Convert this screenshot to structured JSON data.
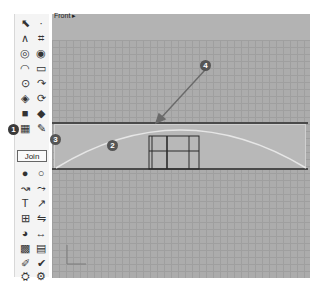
{
  "toolbar": {
    "join_label": "Join",
    "tools": [
      {
        "name": "select-arrow-icon",
        "glyph": "⬉"
      },
      {
        "name": "point-icon",
        "glyph": "·"
      },
      {
        "name": "polyline-icon",
        "glyph": "∧"
      },
      {
        "name": "control-point-curve-icon",
        "glyph": "⌗"
      },
      {
        "name": "circle-icon",
        "glyph": "◎"
      },
      {
        "name": "ellipse-icon",
        "glyph": "◉"
      },
      {
        "name": "arc-icon",
        "glyph": "◠"
      },
      {
        "name": "rectangle-icon",
        "glyph": "▭"
      },
      {
        "name": "polygon-icon",
        "glyph": "⊙"
      },
      {
        "name": "fillet-curve-icon",
        "glyph": "↷"
      },
      {
        "name": "surface-icon",
        "glyph": "◈"
      },
      {
        "name": "revolve-icon",
        "glyph": "⟳"
      },
      {
        "name": "box-solid-icon",
        "glyph": "■"
      },
      {
        "name": "solid-tools-icon",
        "glyph": "◆"
      },
      {
        "name": "mesh-icon",
        "glyph": "▦"
      },
      {
        "name": "explode-icon",
        "glyph": "✎"
      },
      {
        "name": "boolean-union-icon",
        "glyph": "●"
      },
      {
        "name": "boolean-difference-icon",
        "glyph": "○"
      },
      {
        "name": "curve-tools-icon",
        "glyph": "↝"
      },
      {
        "name": "rebuild-icon",
        "glyph": "⤳"
      },
      {
        "name": "transform-icon",
        "glyph": "T"
      },
      {
        "name": "scale-icon",
        "glyph": "↗"
      },
      {
        "name": "array-icon",
        "glyph": "⊞"
      },
      {
        "name": "mirror-icon",
        "glyph": "⇋"
      },
      {
        "name": "render-icon",
        "glyph": "◕"
      },
      {
        "name": "dimension-icon",
        "glyph": "↔"
      },
      {
        "name": "grid-array-icon",
        "glyph": "▩"
      },
      {
        "name": "layer-icon",
        "glyph": "▤"
      },
      {
        "name": "analyze-icon",
        "glyph": "✐"
      },
      {
        "name": "check-icon",
        "glyph": "✔"
      },
      {
        "name": "properties-icon",
        "glyph": "⛭"
      },
      {
        "name": "options-icon",
        "glyph": "⚙"
      }
    ]
  },
  "viewport": {
    "title": "Front",
    "title_menu_glyph": "▸"
  },
  "callouts": [
    {
      "label": "1"
    },
    {
      "label": "2"
    },
    {
      "label": "3"
    },
    {
      "label": "4"
    }
  ],
  "colors": {
    "viewport_bg": "#a9a9a9",
    "grid_line": "#9f9f9f",
    "curve": "#e6e6e6",
    "selected_line": "#4a4a4a"
  }
}
